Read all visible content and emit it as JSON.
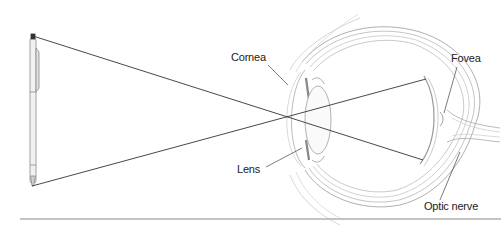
{
  "diagram": {
    "labels": {
      "cornea": "Cornea",
      "lens": "Lens",
      "fovea": "Fovea",
      "optic_nerve": "Optic nerve"
    },
    "objects": [
      "pen",
      "eye",
      "light-rays"
    ],
    "colors": {
      "ray": "#333333",
      "outline": "#9a9a9a",
      "shading": "#d8d8d8",
      "rule": "#b0b0b0"
    }
  }
}
